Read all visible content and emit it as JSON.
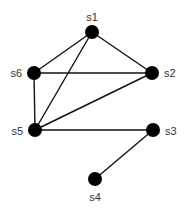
{
  "graph": {
    "node_color": "#000000",
    "edge_color": "#111111",
    "label_color": "#333333",
    "node_radius": 7,
    "nodes": [
      {
        "id": "s1",
        "label": "s1",
        "x": 92,
        "y": 32,
        "lx": 92,
        "ly": 21,
        "anchor": "middle"
      },
      {
        "id": "s2",
        "label": "s2",
        "x": 152,
        "y": 73,
        "lx": 164,
        "ly": 77,
        "anchor": "start"
      },
      {
        "id": "s3",
        "label": "s3",
        "x": 153,
        "y": 130,
        "lx": 165,
        "ly": 135,
        "anchor": "start"
      },
      {
        "id": "s4",
        "label": "s4",
        "x": 95,
        "y": 179,
        "lx": 95,
        "ly": 201,
        "anchor": "middle"
      },
      {
        "id": "s5",
        "label": "s5",
        "x": 35,
        "y": 130,
        "lx": 23,
        "ly": 135,
        "anchor": "end"
      },
      {
        "id": "s6",
        "label": "s6",
        "x": 34,
        "y": 73,
        "lx": 22,
        "ly": 77,
        "anchor": "end"
      }
    ],
    "edges": [
      [
        "s1",
        "s6"
      ],
      [
        "s1",
        "s2"
      ],
      [
        "s1",
        "s5"
      ],
      [
        "s6",
        "s2"
      ],
      [
        "s6",
        "s5"
      ],
      [
        "s2",
        "s5"
      ],
      [
        "s5",
        "s3"
      ],
      [
        "s3",
        "s4"
      ]
    ]
  }
}
